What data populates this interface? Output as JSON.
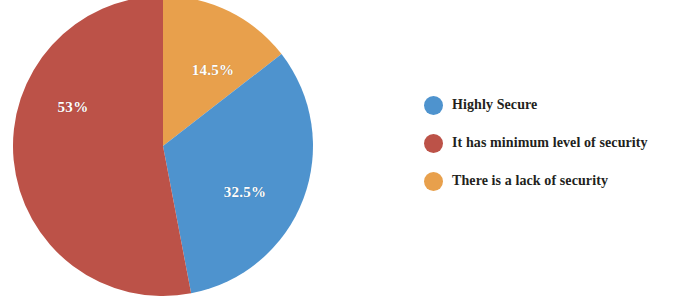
{
  "chart_data": {
    "type": "pie",
    "title": "",
    "subtitle": "",
    "xlabel": "",
    "ylabel": "",
    "grid": false,
    "legend_position": "right",
    "categories": [
      "Highly Secure",
      "It has minimum level of security",
      "There is a lack of security"
    ],
    "values": [
      32.5,
      53,
      14.5
    ],
    "value_labels": [
      "32.5%",
      "53%",
      "14.5%"
    ],
    "colors": [
      "#4E93CE",
      "#BC5248",
      "#E8A04C"
    ],
    "slice_order_clockwise_from_top": [
      {
        "label": "There is a lack of security",
        "value": 14.5,
        "display": "14.5%",
        "color": "#E8A04C"
      },
      {
        "label": "Highly Secure",
        "value": 32.5,
        "display": "32.5%",
        "color": "#4E93CE"
      },
      {
        "label": "It has minimum level of security",
        "value": 53,
        "display": "53%",
        "color": "#BC5248"
      }
    ]
  },
  "pie": {
    "label_orange": "14.5%",
    "label_blue": "32.5%",
    "label_red": "53%"
  },
  "legend": {
    "items": [
      {
        "label": "Highly Secure",
        "color": "#4E93CE",
        "swatch_name": "legend-swatch-highly-secure"
      },
      {
        "label": "It has minimum level of security",
        "color": "#BC5248",
        "swatch_name": "legend-swatch-minimum-security"
      },
      {
        "label": "There is a lack of security",
        "color": "#E8A04C",
        "swatch_name": "legend-swatch-lack-of-security"
      }
    ]
  }
}
